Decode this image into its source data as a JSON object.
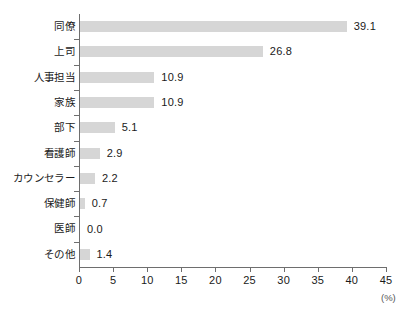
{
  "chart_data": {
    "type": "bar",
    "orientation": "horizontal",
    "title": "",
    "xlabel": "(%)",
    "ylabel": "",
    "categories": [
      "同僚",
      "上司",
      "人事担当",
      "家族",
      "部下",
      "看護師",
      "カウンセラー",
      "保健師",
      "医師",
      "その他"
    ],
    "values": [
      39.1,
      26.8,
      10.9,
      10.9,
      5.1,
      2.9,
      2.2,
      0.7,
      0.0,
      1.4
    ],
    "value_labels": [
      "39.1",
      "26.8",
      "10.9",
      "10.9",
      "5.1",
      "2.9",
      "2.2",
      "0.7",
      "0.0",
      "1.4"
    ],
    "xlim": [
      0,
      45
    ],
    "xticks": [
      0,
      5,
      10,
      15,
      20,
      25,
      30,
      35,
      40,
      45
    ],
    "xtick_labels": [
      "0",
      "5",
      "10",
      "15",
      "20",
      "25",
      "30",
      "35",
      "40",
      "45"
    ],
    "grid": false,
    "legend": null,
    "bar_color": "#d6d6d6",
    "axis_color": "#6e6e6e",
    "text_color": "#1a1a1a",
    "unit": "(%)"
  }
}
